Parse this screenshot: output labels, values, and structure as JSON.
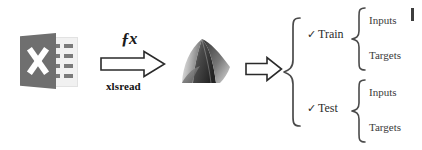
{
  "diagram": {
    "background_color": "#ffffff"
  },
  "source": {
    "icon_name": "excel-file-icon",
    "icon_color": "#6f6f6f",
    "grid_color": "#7a7a7a",
    "mark": "X"
  },
  "transform": {
    "function_symbol": "ƒx",
    "function_name": "xlsread",
    "arrow_name": "right-arrow-icon",
    "arrow_fill": "#ffffff",
    "arrow_stroke": "#2a2a2a"
  },
  "target": {
    "icon_name": "matlab-membrane-logo",
    "label": ""
  },
  "split": {
    "arrow_name": "right-arrow-icon",
    "brace_name": "curly-brace",
    "branches": [
      {
        "check": "✓",
        "label": "Train",
        "leaves": [
          "Inputs",
          "Targets"
        ]
      },
      {
        "check": "✓",
        "label": "Test",
        "leaves": [
          "Inputs",
          "Targets"
        ]
      }
    ]
  },
  "colors": {
    "text": "#2b2b2b",
    "leaf_text": "#3a3a3a",
    "stroke": "#4a4a4a"
  }
}
